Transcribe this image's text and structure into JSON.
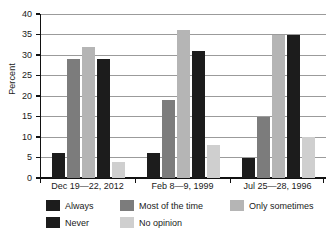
{
  "chart_data": {
    "type": "bar",
    "title": "",
    "subtitle": "",
    "xlabel": "",
    "ylabel": "Percent",
    "ylim": [
      0,
      40
    ],
    "yticks": [
      0,
      5,
      10,
      15,
      20,
      25,
      30,
      35,
      40
    ],
    "ytick_labels": [
      "0",
      "5",
      "10",
      "15",
      "20",
      "25",
      "30",
      "35",
      "40"
    ],
    "grid": true,
    "legend_position": "bottom",
    "categories": [
      "Dec 19—22, 2012",
      "Feb 8—9, 1999",
      "Jul 25—28, 1996"
    ],
    "series": [
      {
        "name": "Always",
        "color": "#1c1c1c",
        "values": [
          6,
          6,
          5
        ]
      },
      {
        "name": "Most of the time",
        "color": "#7c7c7c",
        "values": [
          29,
          19,
          15
        ]
      },
      {
        "name": "Only sometimes",
        "color": "#b5b5b5",
        "values": [
          32,
          36,
          35
        ]
      },
      {
        "name": "Never",
        "color": "#1c1c1c",
        "values": [
          29,
          31,
          35
        ]
      },
      {
        "name": "No opinion",
        "color": "#cfcfcf",
        "values": [
          4,
          8,
          10
        ]
      }
    ]
  },
  "axis": {
    "y_title": "Percent"
  },
  "colors": {
    "gridline": "#9b9b9b",
    "axis": "#111111",
    "background": "#ffffff"
  }
}
